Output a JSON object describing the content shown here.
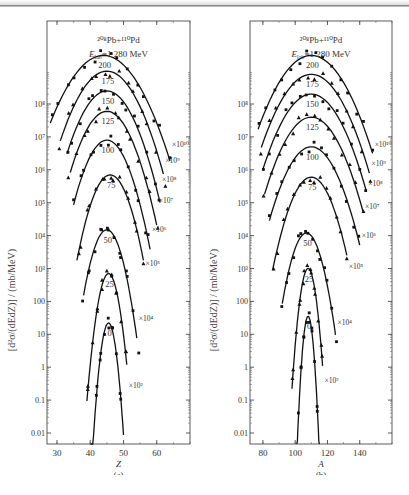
{
  "figure": {
    "caption": "",
    "y_axis_label": "[d²σ/(dEdZ)] / (mb/MeV)"
  },
  "panels": [
    {
      "id": "a",
      "sublabel": "(a)",
      "reaction": "²⁰⁸Pb+¹¹⁰Pd",
      "energy": "E_lab=1 280 MeV",
      "energy_main": "E",
      "energy_sub": "lab",
      "energy_rest": "=1 280 MeV",
      "xlabel": "Z",
      "xticks": [
        "30",
        "40",
        "50",
        "60"
      ],
      "yticks": [
        "0.01",
        "0.1",
        "1",
        "10",
        "100",
        "10³",
        "10⁴",
        "10⁵",
        "10⁶",
        "10⁷",
        "10⁸"
      ]
    },
    {
      "id": "b",
      "sublabel": "(b)",
      "reaction": "²⁰⁸Pb+¹¹⁰Pd",
      "energy": "E_lab=1 280 MeV",
      "energy_main": "E",
      "energy_sub": "lab",
      "energy_rest": "=1 280 MeV",
      "xlabel": "A",
      "xticks": [
        "80",
        "100",
        "120",
        "140"
      ],
      "yticks": [
        "0.01",
        "0.1",
        "1",
        "10",
        "100",
        "10³",
        "10⁴",
        "10⁵",
        "10⁶",
        "10⁷",
        "10⁸"
      ]
    }
  ],
  "chart_data": [
    {
      "type": "scatter",
      "title": "²⁰⁸Pb+¹¹⁰Pd, E_lab=1 280 MeV (a)",
      "xlabel": "Z",
      "ylabel": "[d²σ/(dEdZ)] / (mb/MeV)",
      "xlim": [
        27,
        70
      ],
      "ylim": [
        0.005,
        1000000000000.0
      ],
      "yscale": "log",
      "grid": false,
      "series_labels": [
        "0",
        "25",
        "50",
        "75",
        "100",
        "125",
        "150",
        "175",
        "200"
      ],
      "scale_factors": [
        "×1",
        "×10²",
        "×10⁴",
        "×10⁵",
        "×10⁶",
        "×10⁷",
        "×10⁸",
        "×10⁹",
        "×10¹⁰"
      ],
      "series": [
        {
          "name": "0",
          "scale": "×1",
          "peak_x": 45.5,
          "peak_y": 22,
          "x_range": [
            40,
            50
          ]
        },
        {
          "name": "25",
          "scale": "×10²",
          "peak_x": 45.5,
          "peak_y": 700,
          "x_range": [
            39,
            51
          ]
        },
        {
          "name": "50",
          "scale": "×10⁴",
          "peak_x": 45,
          "peak_y": 15000.0,
          "x_range": [
            38,
            54
          ]
        },
        {
          "name": "75",
          "scale": "×10⁵",
          "peak_x": 46,
          "peak_y": 700000.0,
          "x_range": [
            36,
            56
          ]
        },
        {
          "name": "100",
          "scale": "×10⁶",
          "peak_x": 45,
          "peak_y": 8000000.0,
          "x_range": [
            35,
            58
          ]
        },
        {
          "name": "125",
          "scale": "×10⁷",
          "peak_x": 45,
          "peak_y": 60000000.0,
          "x_range": [
            34,
            60
          ]
        },
        {
          "name": "150",
          "scale": "×10⁸",
          "peak_x": 45,
          "peak_y": 250000000.0,
          "x_range": [
            33,
            61
          ]
        },
        {
          "name": "175",
          "scale": "×10⁹",
          "peak_x": 45,
          "peak_y": 1000000000.0,
          "x_range": [
            31,
            62
          ]
        },
        {
          "name": "200",
          "scale": "×10¹⁰",
          "peak_x": 44,
          "peak_y": 3000000000.0,
          "x_range": [
            28,
            64
          ]
        }
      ]
    },
    {
      "type": "scatter",
      "title": "²⁰⁸Pb+¹¹⁰Pd, E_lab=1 280 MeV (b)",
      "xlabel": "A",
      "ylabel": "[d²σ/(dEdZ)] / (mb/MeV)",
      "xlim": [
        72,
        160
      ],
      "ylim": [
        0.005,
        1000000000000.0
      ],
      "yscale": "log",
      "grid": false,
      "series_labels": [
        "0",
        "25",
        "50",
        "75",
        "100",
        "125",
        "150",
        "175",
        "200"
      ],
      "scale_factors": [
        "×1",
        "×10²",
        "×10⁴",
        "×10⁵",
        "×10⁶",
        "×10⁷",
        "×10⁸",
        "×10⁹",
        "×10¹⁰"
      ],
      "series": [
        {
          "name": "0",
          "scale": "×1",
          "peak_x": 108,
          "peak_y": 35,
          "x_range": [
            101,
            115
          ]
        },
        {
          "name": "25",
          "scale": "×10²",
          "peak_x": 108,
          "peak_y": 1000,
          "x_range": [
            98,
            117
          ]
        },
        {
          "name": "50",
          "scale": "×10⁴",
          "peak_x": 107,
          "peak_y": 12000.0,
          "x_range": [
            92,
            125
          ]
        },
        {
          "name": "75",
          "scale": "×10⁵",
          "peak_x": 110,
          "peak_y": 600000.0,
          "x_range": [
            86,
            132
          ]
        },
        {
          "name": "100",
          "scale": "×10⁶",
          "peak_x": 110,
          "peak_y": 5000000.0,
          "x_range": [
            84,
            140
          ]
        },
        {
          "name": "125",
          "scale": "×10⁷",
          "peak_x": 110,
          "peak_y": 40000000.0,
          "x_range": [
            81,
            142
          ]
        },
        {
          "name": "150",
          "scale": "×10⁸",
          "peak_x": 110,
          "peak_y": 200000000.0,
          "x_range": [
            80,
            144
          ]
        },
        {
          "name": "175",
          "scale": "×10⁹",
          "peak_x": 110,
          "peak_y": 800000000.0,
          "x_range": [
            79,
            146
          ]
        },
        {
          "name": "200",
          "scale": "×10¹⁰",
          "peak_x": 110,
          "peak_y": 3000000000.0,
          "x_range": [
            77,
            148
          ]
        }
      ]
    }
  ]
}
